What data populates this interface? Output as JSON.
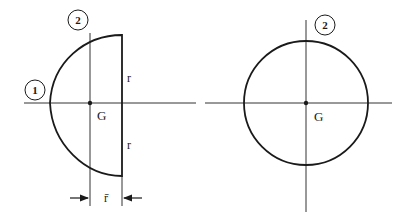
{
  "figures": [
    {
      "name": "semicircle",
      "labels": {
        "axis_1": "1",
        "axis_2": "2",
        "centroid": "G",
        "radius_top": "r",
        "radius_bottom": "r",
        "centroid_offset": "r̄"
      }
    },
    {
      "name": "full-circle",
      "labels": {
        "axis_2": "2",
        "centroid": "G"
      }
    }
  ],
  "colors": {
    "stroke": "#1a1a1a",
    "axis": "#333333",
    "background": "#ffffff"
  }
}
